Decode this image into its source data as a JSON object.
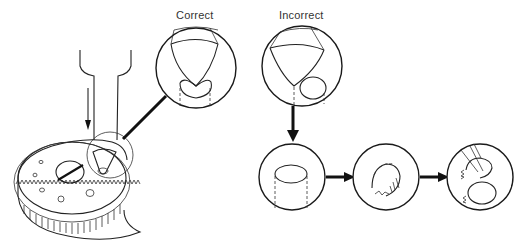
{
  "diagram": {
    "labels": {
      "correct": "Correct",
      "incorrect": "Incorrect"
    },
    "components": [
      {
        "name": "gear-wheel",
        "description": "Toothed gear with slotted screw and holes"
      },
      {
        "name": "drill-tool",
        "description": "Tool pressing down onto gear with conical tip"
      },
      {
        "name": "correct-detail",
        "description": "Magnified view: cone tip centered on hole"
      },
      {
        "name": "incorrect-detail",
        "description": "Magnified view: cone tip off-center"
      },
      {
        "name": "failure-sequence",
        "description": "Three-step sequence showing damage from incorrect alignment"
      }
    ],
    "colors": {
      "line": "#222222",
      "background": "#ffffff",
      "text": "#333333"
    }
  }
}
